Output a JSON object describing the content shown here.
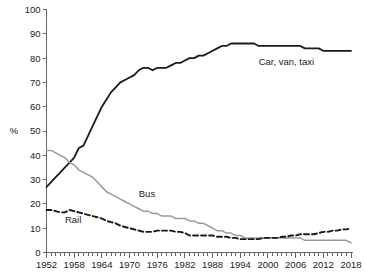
{
  "chart_data": {
    "type": "line",
    "title": "",
    "xlabel": "",
    "ylabel": "%",
    "xlim": [
      1952,
      2018
    ],
    "ylim": [
      0,
      100
    ],
    "grid": false,
    "legend": "inline-annotations",
    "y_ticks": [
      0,
      10,
      20,
      30,
      40,
      50,
      60,
      70,
      80,
      90,
      100
    ],
    "x_ticks_labeled": [
      1952,
      1958,
      1964,
      1970,
      1976,
      1982,
      1988,
      1994,
      2000,
      2006,
      2012,
      2018
    ],
    "x_tick_interval_years": 1,
    "x": [
      1952,
      1953,
      1954,
      1955,
      1956,
      1957,
      1958,
      1959,
      1960,
      1961,
      1962,
      1963,
      1964,
      1965,
      1966,
      1967,
      1968,
      1969,
      1970,
      1971,
      1972,
      1973,
      1974,
      1975,
      1976,
      1977,
      1978,
      1979,
      1980,
      1981,
      1982,
      1983,
      1984,
      1985,
      1986,
      1987,
      1988,
      1989,
      1990,
      1991,
      1992,
      1993,
      1994,
      1995,
      1996,
      1997,
      1998,
      1999,
      2000,
      2001,
      2002,
      2003,
      2004,
      2005,
      2006,
      2007,
      2008,
      2009,
      2010,
      2011,
      2012,
      2013,
      2014,
      2015,
      2016,
      2017,
      2018
    ],
    "series": [
      {
        "name": "Car, van, taxi",
        "color": "#1a1a1a",
        "style": "solid",
        "width": 1.8,
        "label_x": 2004,
        "label_y": 77,
        "values": [
          27,
          29,
          31,
          33,
          35,
          37,
          39,
          43,
          44,
          48,
          52,
          56,
          60,
          63,
          66,
          68,
          70,
          71,
          72,
          73,
          75,
          76,
          76,
          75,
          76,
          76,
          76,
          77,
          78,
          78,
          79,
          80,
          80,
          81,
          81,
          82,
          83,
          84,
          85,
          85,
          86,
          86,
          86,
          86,
          86,
          86,
          85,
          85,
          85,
          85,
          85,
          85,
          85,
          85,
          85,
          85,
          84,
          84,
          84,
          84,
          83,
          83,
          83,
          83,
          83,
          83,
          83
        ]
      },
      {
        "name": "Bus",
        "color": "#9a9a9a",
        "style": "solid",
        "width": 1.5,
        "label_x": 1972,
        "label_y": 23,
        "values": [
          42,
          42,
          41,
          40,
          39,
          37,
          36,
          34,
          33,
          32,
          31,
          29,
          27,
          25,
          24,
          23,
          22,
          21,
          20,
          19,
          18,
          17,
          17,
          16,
          16,
          15,
          15,
          15,
          14,
          14,
          14,
          13,
          13,
          12,
          12,
          11,
          10,
          9,
          9,
          8,
          8,
          7,
          7,
          6,
          6,
          6,
          6,
          6,
          6,
          6,
          6,
          6,
          6,
          6,
          6,
          6,
          5,
          5,
          5,
          5,
          5,
          5,
          5,
          5,
          5,
          5,
          4
        ]
      },
      {
        "name": "Rail",
        "color": "#1a1a1a",
        "style": "dashed",
        "width": 1.9,
        "label_x": 1956,
        "label_y": 12,
        "values": [
          17.5,
          17.5,
          17,
          16.5,
          16.5,
          17.5,
          17,
          16.5,
          16,
          15.5,
          15,
          14.5,
          14,
          13,
          12.5,
          12,
          11,
          10.5,
          10,
          9.5,
          9,
          8.5,
          8.5,
          8.5,
          9,
          9,
          9,
          9,
          8.5,
          8.5,
          8,
          7,
          7,
          7,
          7,
          7,
          7,
          6.5,
          6.5,
          6.5,
          6,
          6,
          5.5,
          5.5,
          5.5,
          5.5,
          5.5,
          6,
          6,
          6,
          6,
          6.5,
          6.5,
          7,
          7,
          7.5,
          7.5,
          7.5,
          7.5,
          8,
          8.5,
          8.5,
          9,
          9,
          9.5,
          9.5,
          10
        ]
      }
    ]
  },
  "labels": {
    "y_axis_title": "%",
    "series_car": "Car, van, taxi",
    "series_bus": "Bus",
    "series_rail": "Rail"
  }
}
